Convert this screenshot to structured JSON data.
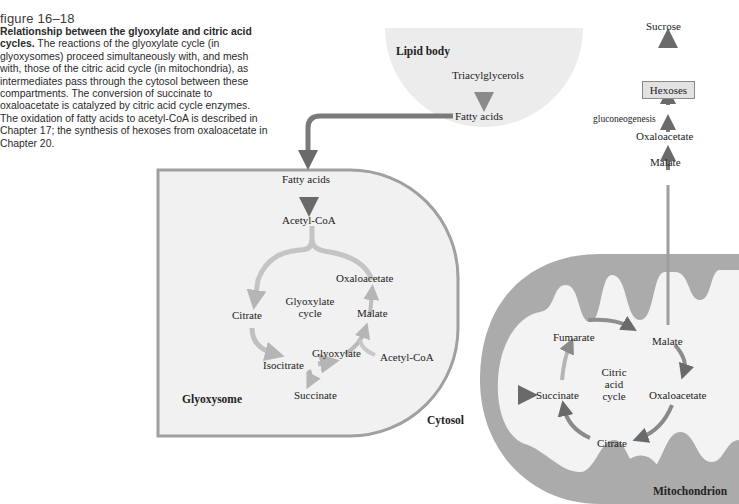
{
  "caption": {
    "figure_number": "figure 16–18",
    "title": "Relationship between the glyoxylate and citric acid cycles.",
    "text": " The reactions of the glyoxylate cycle (in glyoxysomes) proceed simultaneously with, and mesh with, those of the citric acid cycle (in mitochondria), as intermediates pass through the cytosol between these compartments. The conversion of succinate to oxaloacetate is catalyzed by citric acid cycle enzymes. The oxidation of fatty acids to acetyl-CoA is described in Chapter 17; the synthesis of hexoses from oxaloacetate in Chapter 20."
  },
  "compartments": {
    "lipid_body": "Lipid body",
    "glyoxysome": "Glyoxysome",
    "cytosol": "Cytosol",
    "mitochondrion": "Mitochondrion"
  },
  "lipid_body": {
    "triacylglycerols": "Triacylglycerols",
    "fatty_acids": "Fatty acids"
  },
  "glyoxysome": {
    "fatty_acids": "Fatty acids",
    "acetyl_coa_top": "Acetyl-CoA",
    "cycle_name_1": "Glyoxylate",
    "cycle_name_2": "cycle",
    "oxaloacetate": "Oxaloacetate",
    "citrate": "Citrate",
    "malate": "Malate",
    "isocitrate": "Isocitrate",
    "glyoxylate": "Glyoxylate",
    "acetyl_coa_side": "Acetyl-CoA",
    "succinate": "Succinate"
  },
  "mitochondrion": {
    "cycle_name_1": "Citric",
    "cycle_name_2": "acid",
    "cycle_name_3": "cycle",
    "fumarate": "Fumarate",
    "malate": "Malate",
    "succinate": "Succinate",
    "oxaloacetate": "Oxaloacetate",
    "citrate": "Citrate"
  },
  "gluconeogenesis_path": {
    "sucrose": "Sucrose",
    "hexoses": "Hexoses",
    "gluconeogenesis": "gluconeogenesis",
    "oxaloacetate": "Oxaloacetate",
    "malate": "Malate"
  },
  "colors": {
    "arrow_dark": "#6e6e6e",
    "arrow_light": "#c8c8c8",
    "glyoxysome_fill": "#f0f0f0",
    "glyoxysome_border": "#9a9a9a",
    "lipid_fill": "#ececec",
    "mito_outer": "#a9a9a9",
    "mito_inner": "#f3f3f3"
  }
}
